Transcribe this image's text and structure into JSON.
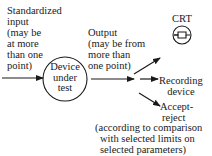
{
  "diagram": {
    "input_label": [
      "Standardized",
      "input",
      "(may be",
      "at more",
      "than one",
      "point)"
    ],
    "device_label": [
      "Device",
      "under",
      "test"
    ],
    "output_label": [
      "Output",
      "(may be from",
      "more than",
      "one point)"
    ],
    "crt_label": "CRT",
    "recording_label": [
      "Recording",
      "device"
    ],
    "accept_label": [
      "Accept-",
      "reject"
    ],
    "accept_note": [
      "(according to comparison",
      "with selected limits on",
      "selected parameters)"
    ],
    "icons": {
      "crt": "crt-display-icon"
    },
    "colors": {
      "ink": "#1a1a1a",
      "background": "#ffffff"
    }
  }
}
